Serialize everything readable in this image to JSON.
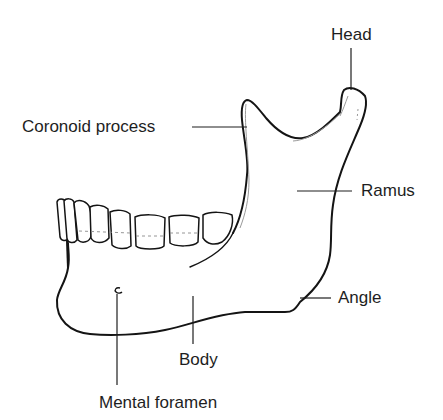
{
  "diagram": {
    "colors": {
      "outline": "#141414",
      "shade": "#9a9a9a",
      "text": "#1e1e1e",
      "background": "#ffffff"
    },
    "labels": {
      "head": "Head",
      "coronoid_process": "Coronoid process",
      "ramus": "Ramus",
      "angle": "Angle",
      "body": "Body",
      "mental_foramen": "Mental foramen"
    }
  }
}
